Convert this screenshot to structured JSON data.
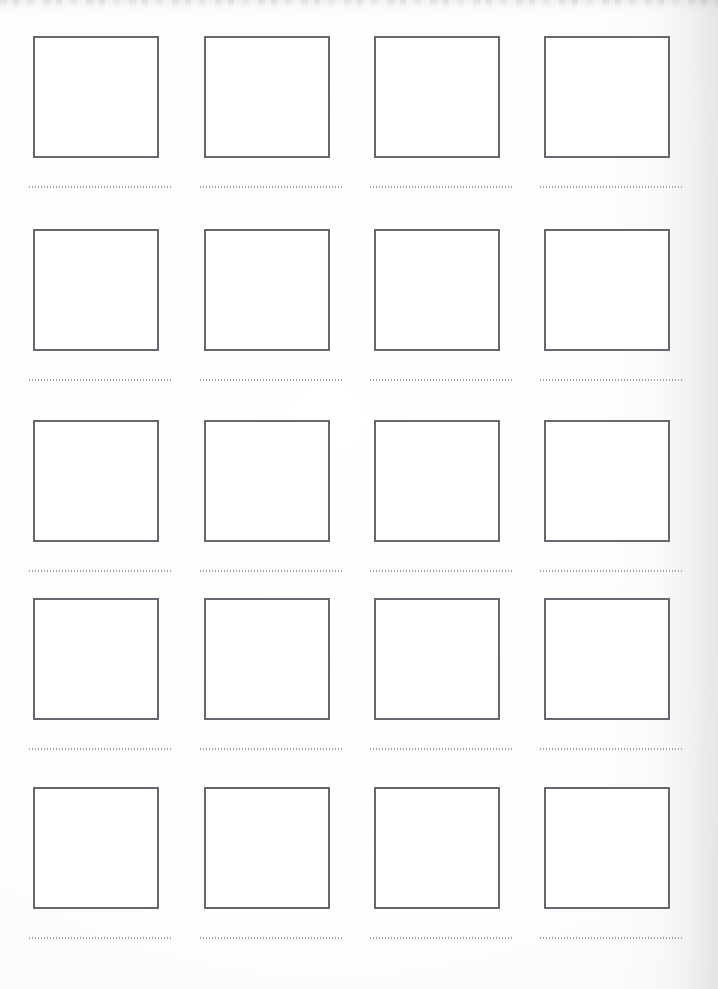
{
  "page": {
    "kind": "scanned-worksheet",
    "width": 718,
    "height": 989,
    "background_color": "#fefefe",
    "paper_tone": "#fdfdfd"
  },
  "artifacts": {
    "top_smudge_color": "#78788016",
    "right_shadow_color": "#94949c21"
  },
  "style_tokens": {
    "box_border_color": "#65656d",
    "box_fill_color": "#ffffff",
    "box_border_width_px": 2,
    "dotted_rule_color": "#9a9aa2",
    "dotted_rule_dot_spacing_px": 3
  },
  "grid": {
    "columns": 4,
    "rows": 5,
    "column_x": [
      33,
      204,
      374,
      544
    ],
    "row_y": [
      36,
      229,
      420,
      598,
      787
    ],
    "box_width": 126,
    "box_height": 122,
    "rule_width": 143,
    "rule_offset_y": 150,
    "cells": [
      {
        "id": "cell-r1c1",
        "row": 1,
        "col": 1,
        "box_label": "",
        "rule_text": ""
      },
      {
        "id": "cell-r1c2",
        "row": 1,
        "col": 2,
        "box_label": "",
        "rule_text": ""
      },
      {
        "id": "cell-r1c3",
        "row": 1,
        "col": 3,
        "box_label": "",
        "rule_text": ""
      },
      {
        "id": "cell-r1c4",
        "row": 1,
        "col": 4,
        "box_label": "",
        "rule_text": ""
      },
      {
        "id": "cell-r2c1",
        "row": 2,
        "col": 1,
        "box_label": "",
        "rule_text": ""
      },
      {
        "id": "cell-r2c2",
        "row": 2,
        "col": 2,
        "box_label": "",
        "rule_text": ""
      },
      {
        "id": "cell-r2c3",
        "row": 2,
        "col": 3,
        "box_label": "",
        "rule_text": ""
      },
      {
        "id": "cell-r2c4",
        "row": 2,
        "col": 4,
        "box_label": "",
        "rule_text": ""
      },
      {
        "id": "cell-r3c1",
        "row": 3,
        "col": 1,
        "box_label": "",
        "rule_text": ""
      },
      {
        "id": "cell-r3c2",
        "row": 3,
        "col": 2,
        "box_label": "",
        "rule_text": ""
      },
      {
        "id": "cell-r3c3",
        "row": 3,
        "col": 3,
        "box_label": "",
        "rule_text": ""
      },
      {
        "id": "cell-r3c4",
        "row": 3,
        "col": 4,
        "box_label": "",
        "rule_text": ""
      },
      {
        "id": "cell-r4c1",
        "row": 4,
        "col": 1,
        "box_label": "",
        "rule_text": ""
      },
      {
        "id": "cell-r4c2",
        "row": 4,
        "col": 2,
        "box_label": "",
        "rule_text": ""
      },
      {
        "id": "cell-r4c3",
        "row": 4,
        "col": 3,
        "box_label": "",
        "rule_text": ""
      },
      {
        "id": "cell-r4c4",
        "row": 4,
        "col": 4,
        "box_label": "",
        "rule_text": ""
      },
      {
        "id": "cell-r5c1",
        "row": 5,
        "col": 1,
        "box_label": "",
        "rule_text": ""
      },
      {
        "id": "cell-r5c2",
        "row": 5,
        "col": 2,
        "box_label": "",
        "rule_text": ""
      },
      {
        "id": "cell-r5c3",
        "row": 5,
        "col": 3,
        "box_label": "",
        "rule_text": ""
      },
      {
        "id": "cell-r5c4",
        "row": 5,
        "col": 4,
        "box_label": "",
        "rule_text": ""
      }
    ]
  }
}
